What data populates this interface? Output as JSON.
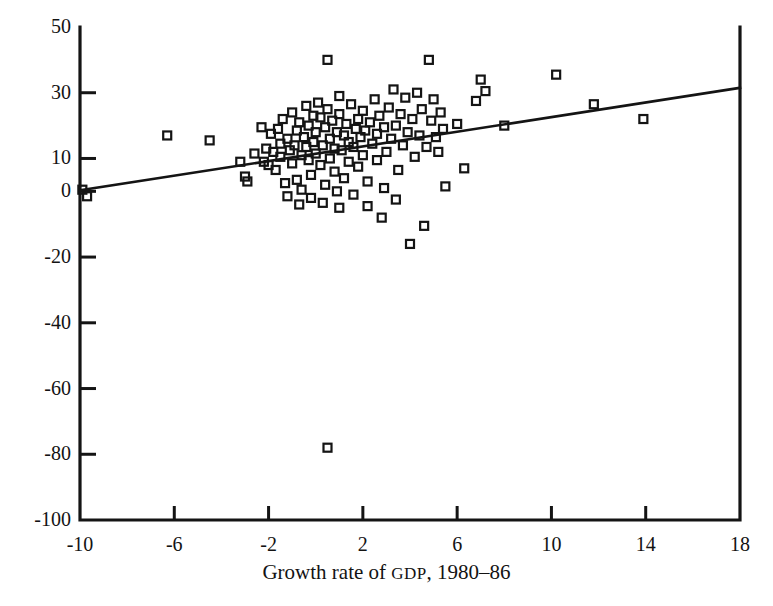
{
  "figure": {
    "clipped_header_text": "",
    "point_marker": "open-square"
  },
  "chart_data": {
    "type": "scatter",
    "title": "",
    "xlabel": "Growth rate of GDP, 1980–86",
    "xlabel_parts": {
      "before": "Growth rate of ",
      "smallcaps": "GDP",
      "after": ", 1980–86"
    },
    "ylabel": "",
    "xlim": [
      -10,
      18
    ],
    "ylim": [
      -100,
      50
    ],
    "xticks": [
      -10,
      -6,
      -2,
      2,
      6,
      10,
      14,
      18
    ],
    "xtick_labels": [
      "-10",
      "-6",
      "-2",
      "2",
      "6",
      "10",
      "14",
      "18"
    ],
    "yticks": [
      50,
      30,
      10,
      0,
      -20,
      -40,
      -60,
      -80,
      -100
    ],
    "ytick_labels": [
      "50",
      "30",
      "10",
      "0",
      "-20",
      "-40",
      "-60",
      "-80",
      "-100"
    ],
    "grid": false,
    "legend": null,
    "marker": "open-square",
    "marker_size_px": 8,
    "series": [
      {
        "name": "observations",
        "points": [
          [
            -9.7,
            -1.5
          ],
          [
            -9.9,
            0.5
          ],
          [
            -6.3,
            17.0
          ],
          [
            -4.5,
            15.5
          ],
          [
            -3.2,
            9.0
          ],
          [
            -3.0,
            4.5
          ],
          [
            -2.9,
            3.0
          ],
          [
            -2.6,
            11.5
          ],
          [
            -2.3,
            19.5
          ],
          [
            -2.2,
            9.0
          ],
          [
            -2.1,
            13.0
          ],
          [
            -2.0,
            8.0
          ],
          [
            -1.9,
            17.5
          ],
          [
            -1.8,
            12.0
          ],
          [
            -1.7,
            6.5
          ],
          [
            -1.6,
            19.0
          ],
          [
            -1.5,
            14.5
          ],
          [
            -1.5,
            10.5
          ],
          [
            -1.4,
            22.0
          ],
          [
            -1.3,
            2.5
          ],
          [
            -1.2,
            16.0
          ],
          [
            -1.1,
            12.5
          ],
          [
            -1.0,
            24.0
          ],
          [
            -1.0,
            8.5
          ],
          [
            -0.9,
            14.0
          ],
          [
            -0.8,
            18.5
          ],
          [
            -0.8,
            3.5
          ],
          [
            -0.7,
            21.0
          ],
          [
            -0.6,
            11.0
          ],
          [
            -0.6,
            0.5
          ],
          [
            -0.5,
            16.5
          ],
          [
            -0.4,
            26.0
          ],
          [
            -0.4,
            13.5
          ],
          [
            -0.3,
            9.5
          ],
          [
            -0.3,
            20.0
          ],
          [
            -0.2,
            5.0
          ],
          [
            -0.1,
            23.0
          ],
          [
            -0.1,
            15.0
          ],
          [
            0.0,
            18.0
          ],
          [
            0.0,
            11.5
          ],
          [
            0.1,
            27.0
          ],
          [
            0.2,
            22.5
          ],
          [
            0.2,
            8.0
          ],
          [
            0.3,
            14.0
          ],
          [
            0.4,
            19.5
          ],
          [
            0.4,
            2.0
          ],
          [
            0.5,
            40.0
          ],
          [
            0.5,
            -78.0
          ],
          [
            0.5,
            25.0
          ],
          [
            0.6,
            16.0
          ],
          [
            0.6,
            10.0
          ],
          [
            0.7,
            21.5
          ],
          [
            0.8,
            13.0
          ],
          [
            0.8,
            6.0
          ],
          [
            0.9,
            18.0
          ],
          [
            1.0,
            29.0
          ],
          [
            1.0,
            23.5
          ],
          [
            1.1,
            12.5
          ],
          [
            1.2,
            17.0
          ],
          [
            1.2,
            4.0
          ],
          [
            1.3,
            20.5
          ],
          [
            1.4,
            15.0
          ],
          [
            1.4,
            9.0
          ],
          [
            1.5,
            26.5
          ],
          [
            1.6,
            13.5
          ],
          [
            1.7,
            19.0
          ],
          [
            1.8,
            22.0
          ],
          [
            1.8,
            7.5
          ],
          [
            1.9,
            16.5
          ],
          [
            2.0,
            11.0
          ],
          [
            2.0,
            24.5
          ],
          [
            2.1,
            18.5
          ],
          [
            2.2,
            3.0
          ],
          [
            2.3,
            21.0
          ],
          [
            2.4,
            14.5
          ],
          [
            2.5,
            28.0
          ],
          [
            2.6,
            17.5
          ],
          [
            2.6,
            9.5
          ],
          [
            2.7,
            23.0
          ],
          [
            2.8,
            -8.0
          ],
          [
            2.9,
            19.5
          ],
          [
            3.0,
            12.0
          ],
          [
            3.1,
            25.5
          ],
          [
            3.2,
            16.0
          ],
          [
            3.3,
            31.0
          ],
          [
            3.4,
            20.0
          ],
          [
            3.5,
            6.5
          ],
          [
            3.6,
            23.5
          ],
          [
            3.7,
            14.0
          ],
          [
            3.8,
            28.5
          ],
          [
            3.9,
            18.0
          ],
          [
            4.0,
            -16.0
          ],
          [
            4.1,
            22.0
          ],
          [
            4.2,
            10.5
          ],
          [
            4.3,
            30.0
          ],
          [
            4.4,
            17.0
          ],
          [
            4.5,
            25.0
          ],
          [
            4.6,
            -10.5
          ],
          [
            4.7,
            13.5
          ],
          [
            4.8,
            40.0
          ],
          [
            4.9,
            21.5
          ],
          [
            5.0,
            28.0
          ],
          [
            5.1,
            16.5
          ],
          [
            5.2,
            12.0
          ],
          [
            5.3,
            24.0
          ],
          [
            5.4,
            19.0
          ],
          [
            5.5,
            1.5
          ],
          [
            6.0,
            20.5
          ],
          [
            6.3,
            7.0
          ],
          [
            6.8,
            27.5
          ],
          [
            7.0,
            34.0
          ],
          [
            7.2,
            30.5
          ],
          [
            8.0,
            20.0
          ],
          [
            10.2,
            35.5
          ],
          [
            11.8,
            26.5
          ],
          [
            13.9,
            22.0
          ],
          [
            -0.2,
            -2.0
          ],
          [
            0.3,
            -3.5
          ],
          [
            1.0,
            -5.0
          ],
          [
            1.6,
            -1.0
          ],
          [
            2.2,
            -4.5
          ],
          [
            -1.2,
            -1.5
          ],
          [
            -0.7,
            -4.0
          ],
          [
            0.9,
            0.0
          ],
          [
            3.4,
            -2.5
          ],
          [
            2.9,
            1.0
          ]
        ]
      }
    ],
    "trendline": {
      "name": "fitted regression line",
      "x_start": -10,
      "y_start": 0.3,
      "x_end": 18,
      "y_end": 31.5
    }
  },
  "axes_geometry": {
    "note": "plot frame pixel bounds",
    "left_px": 80,
    "right_px": 740,
    "top_px": 27,
    "bottom_px": 520
  }
}
